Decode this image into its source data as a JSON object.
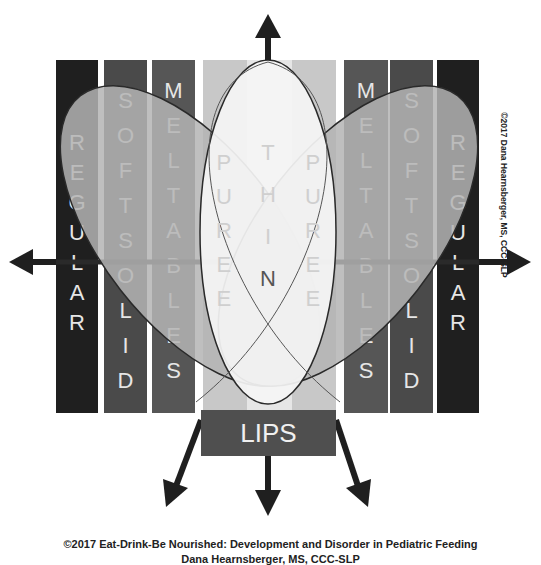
{
  "diagram": {
    "columns_left": [
      {
        "id": "regular",
        "letters": [
          "R",
          "E",
          "G",
          "U",
          "L",
          "A",
          "R"
        ]
      },
      {
        "id": "soft_solid",
        "letters": [
          "S",
          "O",
          "F",
          "T",
          "S",
          "O",
          "L",
          "I",
          "D"
        ]
      },
      {
        "id": "meltables",
        "letters": [
          "M",
          "E",
          "L",
          "T",
          "A",
          "B",
          "L",
          "E",
          "S"
        ]
      }
    ],
    "columns_right": [
      {
        "id": "meltables",
        "letters": [
          "M",
          "E",
          "L",
          "T",
          "A",
          "B",
          "L",
          "E",
          "S"
        ]
      },
      {
        "id": "soft_solid",
        "letters": [
          "S",
          "O",
          "F",
          "T",
          "S",
          "O",
          "L",
          "I",
          "D"
        ]
      },
      {
        "id": "regular",
        "letters": [
          "R",
          "E",
          "G",
          "U",
          "L",
          "A",
          "R"
        ]
      }
    ],
    "center": {
      "puree_left": [
        "P",
        "U",
        "R",
        "E",
        "E"
      ],
      "thin": [
        "T",
        "H",
        "I",
        "N"
      ],
      "puree_right": [
        "P",
        "U",
        "R",
        "E",
        "E"
      ]
    },
    "lips_label": "LIPS",
    "arrows": [
      "up",
      "left",
      "right",
      "down-left",
      "down",
      "down-right"
    ],
    "colors": {
      "regular": "#1f1f1f",
      "soft_solid": "#4a4a4a",
      "meltables": "#565656",
      "puree": "#c8c8c8",
      "thin": "#e6e6e6",
      "oval_fill": "#b4b4b4",
      "lips": "#4f4f4f"
    }
  },
  "copyright_side": "©2017 Dana Hearnsberger, MS, CCC-SLP",
  "footer": {
    "line1": "©2017 Eat-Drink-Be Nourished:  Development and Disorder in Pediatric Feeding",
    "line2": "Dana Hearnsberger, MS, CCC-SLP"
  }
}
